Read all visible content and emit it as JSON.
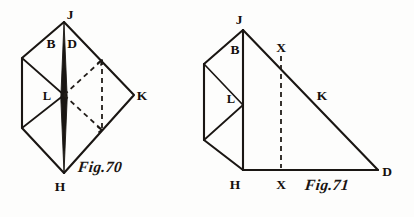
{
  "plate": {
    "name": "geometry-figure-plate",
    "background_color": "#fdfdfc",
    "ink_color": "#1a1613",
    "width": 414,
    "height": 217
  },
  "figures": [
    {
      "id": "fig70",
      "caption": "Fig.70",
      "description": "Rhombus-shaped net diagram with solid outline, central vertical spine, and an inscribed dashed square.",
      "labels": [
        {
          "key": "J",
          "text": "J",
          "x": 70,
          "y": 19
        },
        {
          "key": "B",
          "text": "B",
          "x": 51,
          "y": 48
        },
        {
          "key": "D",
          "text": "D",
          "x": 70,
          "y": 48
        },
        {
          "key": "L",
          "text": "L",
          "x": 47,
          "y": 100
        },
        {
          "key": "K",
          "text": "K",
          "x": 139,
          "y": 100
        },
        {
          "key": "H",
          "text": "H",
          "x": 58,
          "y": 190
        }
      ],
      "vertices": {
        "J": [
          64,
          22
        ],
        "B": [
          22,
          58
        ],
        "L": [
          64,
          95
        ],
        "K": [
          134,
          95
        ],
        "H": [
          64,
          173
        ],
        "Wb": [
          22,
          128
        ]
      }
    },
    {
      "id": "fig71",
      "caption": "Fig.71",
      "description": "Right triangle J-H-D with a zigzag strip on the left flank, a dashed vertical from hypotenuse point X down to base point X.",
      "labels": [
        {
          "key": "J",
          "text": "J",
          "x": 239,
          "y": 22
        },
        {
          "key": "B",
          "text": "B",
          "x": 238,
          "y": 52
        },
        {
          "key": "X1",
          "text": "X",
          "x": 278,
          "y": 52
        },
        {
          "key": "L",
          "text": "L",
          "x": 231,
          "y": 101
        },
        {
          "key": "K",
          "text": "K",
          "x": 320,
          "y": 99
        },
        {
          "key": "H",
          "text": "H",
          "x": 232,
          "y": 190
        },
        {
          "key": "X2",
          "text": "X",
          "x": 276,
          "y": 190
        },
        {
          "key": "D",
          "text": "D",
          "x": 383,
          "y": 175
        }
      ],
      "vertices": {
        "J": [
          243,
          30
        ],
        "H": [
          243,
          170
        ],
        "D": [
          378,
          170
        ],
        "Xh": [
          281,
          56
        ],
        "Xb": [
          281,
          170
        ],
        "Wt": [
          204,
          64
        ],
        "L": [
          243,
          105
        ],
        "Wb": [
          204,
          140
        ]
      }
    }
  ]
}
